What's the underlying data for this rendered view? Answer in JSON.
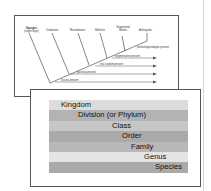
{
  "cladogram": {
    "taxa": [
      "Sponges",
      "Cnidarians",
      "Roundworms",
      "Mollusks",
      "Segmented Worms",
      "Arthropods"
    ],
    "sponge_note": "(single layer)",
    "traits": [
      "jointed appendages present",
      "segmentation present",
      "true coelom present",
      "gastrula present",
      "tissues present"
    ]
  },
  "taxonomy": {
    "levels": [
      {
        "label": "Kingdom",
        "color": "#dcdcdc",
        "indent": 12
      },
      {
        "label": "Division  (or Phylum)",
        "color": "#b3b3b3",
        "indent": 29
      },
      {
        "label": "Class",
        "color": "#c6c6c6",
        "indent": 63
      },
      {
        "label": "Order",
        "color": "#aaaaaa",
        "indent": 73
      },
      {
        "label": "Family",
        "color": "#b8b8b8",
        "indent": 82
      },
      {
        "label": "Genus",
        "color": "#e4e4e4",
        "indent": 95
      },
      {
        "label": "Species",
        "color": "#aaaaaa",
        "indent": 106
      }
    ]
  }
}
